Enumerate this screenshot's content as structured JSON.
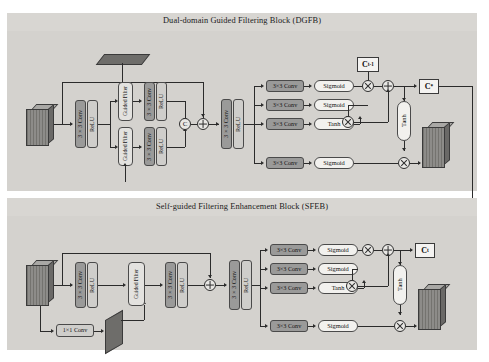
{
  "figure": {
    "type": "neural-network-architecture-diagram",
    "blocks": [
      {
        "id": "dgfb",
        "title": "Dual-domain Guided Filtering Block (DGFB)",
        "input_label": "feature-cube",
        "guide_label": "guide-plane",
        "stage1": {
          "conv": "3×3 Conv",
          "act": "ReLU"
        },
        "branches": [
          {
            "filter": "Guided Filter",
            "conv": "3×3 Conv",
            "act": "ReLU"
          },
          {
            "filter": "Guided Filter",
            "conv": "3×3 Conv",
            "act": "ReLU"
          }
        ],
        "concat_op": "C",
        "add_op": "+",
        "stage2": {
          "conv": "3×3 Conv",
          "act": "ReLU"
        },
        "gates": [
          {
            "conv": "3×3 Conv",
            "act": "Sigmoid",
            "role": "forget-gate"
          },
          {
            "conv": "3×3 Conv",
            "act": "Sigmoid",
            "role": "input-gate"
          },
          {
            "conv": "3×3 Conv",
            "act": "Tanh",
            "role": "candidate-gate"
          },
          {
            "conv": "3×3 Conv",
            "act": "Sigmoid",
            "role": "output-gate"
          }
        ],
        "cell_in": {
          "base": "C",
          "sub": "t-1"
        },
        "cell_out": {
          "base": "C",
          "sup": "*"
        },
        "tanh": "Tanh",
        "output_label": "output-cube"
      },
      {
        "id": "sfeb",
        "title": "Self-guided Filtering Enhancement Block (SFEB)",
        "input_label": "feature-cube",
        "guide_conv": "1×1 Conv",
        "guide_label": "guide-plane",
        "stage1": {
          "conv": "3×3 Conv",
          "act": "ReLU"
        },
        "filter": "Guided Filter",
        "stage2": {
          "conv": "3×3 Conv",
          "act": "ReLU"
        },
        "add_op": "+",
        "stage3": {
          "conv": "3×3 Conv",
          "act": "ReLU"
        },
        "gates": [
          {
            "conv": "3×3 Conv",
            "act": "Sigmoid",
            "role": "forget-gate"
          },
          {
            "conv": "3×3 Conv",
            "act": "Sigmoid",
            "role": "input-gate"
          },
          {
            "conv": "3×3 Conv",
            "act": "Tanh",
            "role": "candidate-gate"
          },
          {
            "conv": "3×3 Conv",
            "act": "Sigmoid",
            "role": "output-gate"
          }
        ],
        "cell_out": {
          "base": "C",
          "sub": "t"
        },
        "tanh": "Tanh",
        "output_label": "output-cube"
      }
    ],
    "colors": {
      "page": "#ffffff",
      "panel": "#d8d6d2",
      "conv_fill": "#9a9a99",
      "relu_fill": "#cfcecb",
      "act_fill": "#f2f1ee",
      "guided_filter_fill": "#e3e2df",
      "wire": "#2b2b2b",
      "cube_fill": "#7f7e7c",
      "plane_fill": "#6e6d6a"
    }
  }
}
